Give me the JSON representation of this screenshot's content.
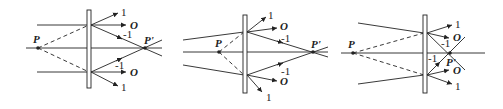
{
  "figure": {
    "panels": [
      {
        "id": "panel-a",
        "source_label": "P",
        "image_label": "P'",
        "orders_upper": [
          "1",
          "O",
          "-1"
        ],
        "orders_lower": [
          "-1",
          "O",
          "1"
        ]
      },
      {
        "id": "panel-b",
        "source_label": "P",
        "image_label": "P'",
        "orders_upper": [
          "1",
          "O",
          "-1"
        ],
        "orders_lower": [
          "-1",
          "O",
          "1"
        ]
      },
      {
        "id": "panel-c",
        "source_label": "P",
        "image_label": "P'",
        "orders_upper": [
          "1",
          "O",
          "-1"
        ],
        "orders_lower": [
          "-1",
          "O",
          "1"
        ]
      }
    ],
    "colors": {
      "line": "#222222",
      "background": "#ffffff"
    }
  }
}
